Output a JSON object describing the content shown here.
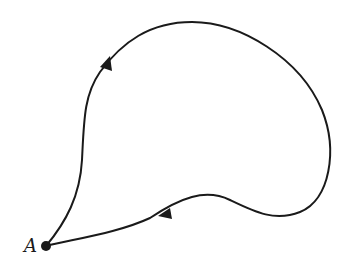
{
  "diagram": {
    "type": "closed-path-with-direction",
    "point": {
      "label": "A",
      "x": 46,
      "y": 246
    },
    "path_direction": "counterclockwise-from-A: up the left side, across the top, down the right, back along the bottom to A",
    "arrows": [
      {
        "position": "upper-left",
        "x": 107,
        "y": 61,
        "direction": "up-right"
      },
      {
        "position": "lower-middle",
        "x": 164,
        "y": 212,
        "direction": "down-left"
      }
    ],
    "colors": {
      "stroke": "#1a1a1a",
      "background": "#ffffff"
    }
  }
}
